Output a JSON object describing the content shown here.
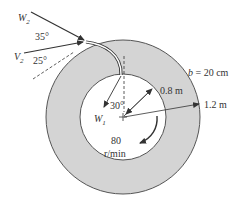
{
  "diagram": {
    "colors": {
      "ring_fill": "#d4d4d4",
      "ring_stroke": "#555555",
      "inner_fill": "#ffffff",
      "line": "#333333",
      "text": "#333333"
    },
    "labels": {
      "w2": "W",
      "w2_sub": "2",
      "v2": "V",
      "v2_sub": "2",
      "w1": "W",
      "w1_sub": "1",
      "angle_35": "35°",
      "angle_25": "25°",
      "angle_30": "30°",
      "inner_radius": "0.8 m",
      "outer_radius": "1.2 m",
      "width": "b = 20 cm",
      "speed_value": "80",
      "speed_unit": "r/min"
    },
    "values": {
      "inner_radius_m": 0.8,
      "outer_radius_m": 1.2,
      "blade_width_cm": 20,
      "rotation_rpm": 80,
      "exit_relative_angle_deg": 35,
      "exit_absolute_angle_deg": 25,
      "inlet_angle_deg": 30
    }
  }
}
